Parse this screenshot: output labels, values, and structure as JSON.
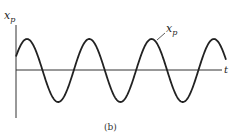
{
  "figure": {
    "caption": "(b)",
    "y_axis_label": "x",
    "y_axis_label_sub": "p",
    "x_axis_label": "t",
    "curve_label": "x",
    "curve_label_sub": "p"
  },
  "colors": {
    "background": "#ffffff",
    "stroke": "#222222"
  },
  "chart_data": {
    "type": "line",
    "title": "",
    "xlabel": "t",
    "ylabel": "x_p",
    "series": [
      {
        "name": "x_p",
        "function": "A*cos(omega*t - phi)",
        "amplitude_rel": 1.0,
        "cycles_shown": 3.4
      }
    ],
    "grid": false,
    "legend": "none"
  }
}
